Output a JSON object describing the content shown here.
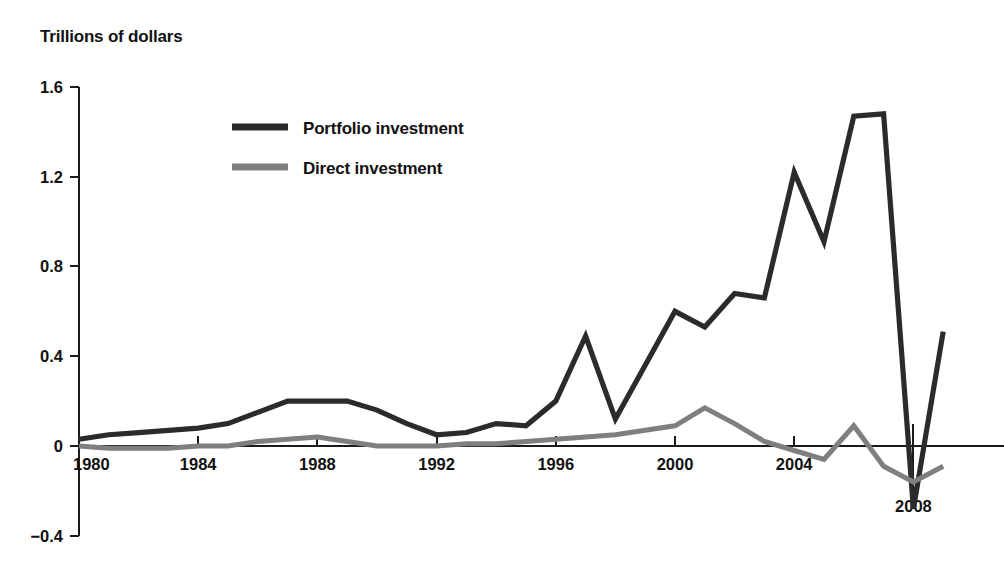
{
  "figure": {
    "title": "Trillions of dollars",
    "width": 1004,
    "height": 575,
    "background": "#ffffff"
  },
  "colors": {
    "portfolio": "#2b2b2b",
    "direct": "#7f7f7f",
    "axis": "#1a1a1a",
    "text": "#111111"
  },
  "chart_data": {
    "type": "line",
    "title": "Trillions of dollars",
    "xlabel": "",
    "ylabel": "Trillions of dollars",
    "xlim": [
      1980,
      2009
    ],
    "ylim": [
      -0.4,
      1.6
    ],
    "yticks": [
      -0.4,
      0,
      0.4,
      0.8,
      1.2,
      1.6
    ],
    "ytick_labels": [
      "−0.4",
      "0",
      "0.4",
      "0.8",
      "1.2",
      "1.6"
    ],
    "xticks": [
      1980,
      1984,
      1988,
      1992,
      1996,
      2000,
      2004,
      2008
    ],
    "xtick_labels": [
      "1980",
      "1984",
      "1988",
      "1992",
      "1996",
      "2000",
      "2004",
      "2008"
    ],
    "grid": false,
    "legend_position": "upper-center-left",
    "x": [
      1980,
      1981,
      1982,
      1983,
      1984,
      1985,
      1986,
      1987,
      1988,
      1989,
      1990,
      1991,
      1992,
      1993,
      1994,
      1995,
      1996,
      1997,
      1998,
      1999,
      2000,
      2001,
      2002,
      2003,
      2004,
      2005,
      2006,
      2007,
      2008,
      2009
    ],
    "series": [
      {
        "name": "Portfolio investment",
        "color": "#2b2b2b",
        "values": [
          0.03,
          0.05,
          0.06,
          0.07,
          0.08,
          0.1,
          0.15,
          0.2,
          0.2,
          0.2,
          0.16,
          0.1,
          0.05,
          0.06,
          0.1,
          0.09,
          0.2,
          0.49,
          0.12,
          0.36,
          0.6,
          0.53,
          0.68,
          0.66,
          1.22,
          0.91,
          1.47,
          1.48,
          -0.28,
          0.51
        ]
      },
      {
        "name": "Direct investment",
        "color": "#7f7f7f",
        "values": [
          0.0,
          -0.01,
          -0.01,
          -0.01,
          0.0,
          0.0,
          0.02,
          0.03,
          0.04,
          0.02,
          0.0,
          0.0,
          0.0,
          0.01,
          0.01,
          0.02,
          0.03,
          0.04,
          0.05,
          0.07,
          0.09,
          0.17,
          0.1,
          0.02,
          -0.02,
          -0.06,
          0.09,
          -0.09,
          -0.16,
          -0.09
        ]
      }
    ]
  },
  "legend": {
    "entries": [
      {
        "label": "Portfolio investment",
        "color": "#2b2b2b"
      },
      {
        "label": "Direct investment",
        "color": "#7f7f7f"
      }
    ]
  }
}
